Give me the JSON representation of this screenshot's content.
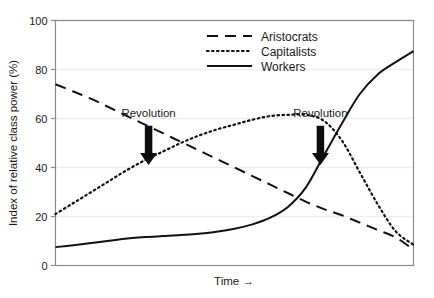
{
  "chart_data": {
    "type": "line",
    "title": "",
    "subtitle": "",
    "xlabel": "Time →",
    "ylabel": "Index of relative class power (%)",
    "xlim": [
      0,
      100
    ],
    "ylim": [
      0,
      100
    ],
    "grid": true,
    "x_ticks": [],
    "x_tick_labels": [],
    "y_ticks": [
      0,
      20,
      40,
      60,
      80,
      100
    ],
    "y_tick_labels": [
      "0",
      "20",
      "40",
      "60",
      "80",
      "100"
    ],
    "legend_position": "top-center",
    "series": [
      {
        "name": "Aristocrats",
        "style": "dashed",
        "color": "#111111",
        "x": [
          0,
          5,
          10,
          15,
          20,
          25,
          30,
          35,
          40,
          45,
          50,
          55,
          60,
          65,
          70,
          75,
          80,
          85,
          90,
          95,
          100
        ],
        "values": [
          74,
          71,
          68,
          64.5,
          61,
          57.5,
          54,
          50.5,
          47,
          43.5,
          40,
          36.5,
          33,
          29.5,
          26,
          23,
          20.5,
          17.5,
          14.5,
          11.5,
          6.5
        ]
      },
      {
        "name": "Capitalists",
        "style": "dotted",
        "color": "#111111",
        "x": [
          0,
          5,
          10,
          15,
          20,
          25,
          30,
          35,
          40,
          45,
          50,
          55,
          60,
          65,
          70,
          75,
          80,
          85,
          90,
          95,
          100
        ],
        "values": [
          21,
          25.5,
          30,
          34.5,
          39,
          43,
          46.5,
          50,
          53,
          55.5,
          57.5,
          59.5,
          61,
          61.5,
          61.5,
          59,
          51,
          38,
          25,
          14,
          8.5
        ]
      },
      {
        "name": "Workers",
        "style": "solid",
        "color": "#111111",
        "x": [
          0,
          5,
          10,
          15,
          20,
          25,
          30,
          35,
          40,
          45,
          50,
          55,
          60,
          65,
          70,
          75,
          80,
          85,
          90,
          95,
          100
        ],
        "values": [
          7.5,
          8.3,
          9.2,
          10.1,
          11,
          11.6,
          12,
          12.4,
          13,
          13.8,
          15,
          16.8,
          19.5,
          24,
          32,
          45,
          58,
          70,
          78,
          83,
          87.5
        ]
      }
    ],
    "annotations": [
      {
        "label": "Revolution",
        "x": 26,
        "arrow_top": 57,
        "arrow_bottom": 41
      },
      {
        "label": "Revolution",
        "x": 74,
        "arrow_top": 57,
        "arrow_bottom": 41
      }
    ]
  },
  "legend": {
    "items": [
      {
        "label": "Aristocrats",
        "style": "dashed"
      },
      {
        "label": "Capitalists",
        "style": "dotted"
      },
      {
        "label": "Workers",
        "style": "solid"
      }
    ]
  }
}
